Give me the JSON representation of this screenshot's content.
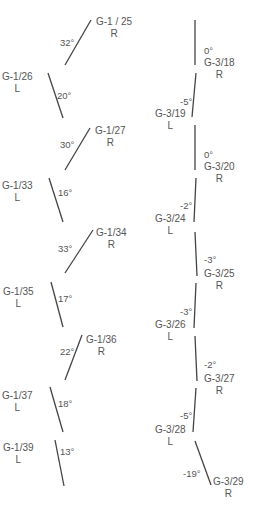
{
  "colors": {
    "line": "#444444",
    "text": "#555555",
    "background": "#ffffff"
  },
  "left_column": {
    "series": "G-1",
    "items": [
      {
        "id": "G-1 / 25",
        "side": "R",
        "angle": "32°",
        "x1": 91,
        "y1": 20,
        "x2": 65,
        "y2": 65,
        "lx": 96,
        "ly": 16,
        "ax": 60,
        "ay": 37
      },
      {
        "id": "G-1/26",
        "side": "L",
        "angle": "20°",
        "x1": 48,
        "y1": 73,
        "x2": 63,
        "y2": 118,
        "lx": 2,
        "ly": 71,
        "ax": 57,
        "ay": 90
      },
      {
        "id": "G-1/27",
        "side": "R",
        "angle": "30°",
        "x1": 90,
        "y1": 128,
        "x2": 65,
        "y2": 170,
        "lx": 95,
        "ly": 125,
        "ax": 60,
        "ay": 139
      },
      {
        "id": "G-1/33",
        "side": "L",
        "angle": "16°",
        "x1": 49,
        "y1": 178,
        "x2": 63,
        "y2": 222,
        "lx": 2,
        "ly": 180,
        "ax": 58,
        "ay": 187
      },
      {
        "id": "G-1/34",
        "side": "R",
        "angle": "33°",
        "x1": 93,
        "y1": 230,
        "x2": 65,
        "y2": 273,
        "lx": 96,
        "ly": 227,
        "ax": 58,
        "ay": 243
      },
      {
        "id": "G-1/35",
        "side": "L",
        "angle": "17°",
        "x1": 51,
        "y1": 282,
        "x2": 63,
        "y2": 327,
        "lx": 3,
        "ly": 286,
        "ax": 58,
        "ay": 293
      },
      {
        "id": "G-1/36",
        "side": "R",
        "angle": "22°",
        "x1": 82,
        "y1": 335,
        "x2": 65,
        "y2": 380,
        "lx": 86,
        "ly": 334,
        "ax": 60,
        "ay": 346
      },
      {
        "id": "G-1/37",
        "side": "L",
        "angle": "18°",
        "x1": 50,
        "y1": 387,
        "x2": 63,
        "y2": 432,
        "lx": 2,
        "ly": 390,
        "ax": 58,
        "ay": 398
      },
      {
        "id": "G-1/39",
        "side": "L",
        "angle": "13°",
        "x1": 55,
        "y1": 440,
        "x2": 64,
        "y2": 486,
        "lx": 3,
        "ly": 442,
        "ax": 60,
        "ay": 446
      }
    ]
  },
  "right_column": {
    "series": "G-3",
    "items": [
      {
        "id": "G-3/18",
        "side": "R",
        "angle": "0°",
        "x1": 195,
        "y1": 20,
        "x2": 195,
        "y2": 65,
        "lx": 204,
        "ly": 57,
        "ax": 204,
        "ay": 45
      },
      {
        "id": "G-3/19",
        "side": "L",
        "angle": "-5°",
        "x1": 196,
        "y1": 73,
        "x2": 192,
        "y2": 117,
        "lx": 155,
        "ly": 108,
        "ax": 180,
        "ay": 96
      },
      {
        "id": "G-3/20",
        "side": "R",
        "angle": "0°",
        "x1": 195,
        "y1": 125,
        "x2": 195,
        "y2": 170,
        "lx": 204,
        "ly": 161,
        "ax": 204,
        "ay": 149
      },
      {
        "id": "G-3/24",
        "side": "L",
        "angle": "-2°",
        "x1": 196,
        "y1": 178,
        "x2": 194,
        "y2": 222,
        "lx": 155,
        "ly": 213,
        "ax": 180,
        "ay": 200
      },
      {
        "id": "G-3/25",
        "side": "R",
        "angle": "-3°",
        "x1": 195,
        "y1": 232,
        "x2": 197,
        "y2": 276,
        "lx": 204,
        "ly": 268,
        "ax": 204,
        "ay": 254
      },
      {
        "id": "G-3/26",
        "side": "L",
        "angle": "-3°",
        "x1": 196,
        "y1": 283,
        "x2": 194,
        "y2": 328,
        "lx": 155,
        "ly": 319,
        "ax": 180,
        "ay": 306
      },
      {
        "id": "G-3/27",
        "side": "R",
        "angle": "-2°",
        "x1": 195,
        "y1": 336,
        "x2": 197,
        "y2": 381,
        "lx": 204,
        "ly": 373,
        "ax": 204,
        "ay": 359
      },
      {
        "id": "G-3/28",
        "side": "L",
        "angle": "-5°",
        "x1": 196,
        "y1": 388,
        "x2": 193,
        "y2": 432,
        "lx": 155,
        "ly": 424,
        "ax": 180,
        "ay": 410
      },
      {
        "id": "G-3/29",
        "side": "R",
        "angle": "-19°",
        "x1": 195,
        "y1": 441,
        "x2": 211,
        "y2": 485,
        "lx": 213,
        "ly": 476,
        "ax": 183,
        "ay": 468
      }
    ]
  }
}
